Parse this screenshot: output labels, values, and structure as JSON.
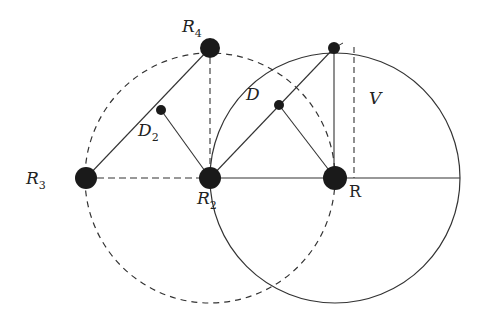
{
  "diagram": {
    "colors": {
      "stroke": "#333333",
      "node": "#1a1a1a",
      "background": "#ffffff"
    },
    "labels": {
      "R4": {
        "main": "R",
        "sub": "4"
      },
      "R3": {
        "main": "R",
        "sub": "3"
      },
      "R2": {
        "main": "R",
        "sub": "2"
      },
      "D2": {
        "main": "D",
        "sub": "2"
      },
      "D": "D",
      "V": "V",
      "R": "R"
    },
    "nodes": [
      {
        "id": "R3",
        "x": 86,
        "y": 178,
        "r": 11
      },
      {
        "id": "R2",
        "x": 210,
        "y": 178,
        "r": 11
      },
      {
        "id": "R",
        "x": 335,
        "y": 178,
        "r": 12
      },
      {
        "id": "R4",
        "x": 210,
        "y": 48,
        "r": 10
      },
      {
        "id": "top",
        "x": 334,
        "y": 48,
        "r": 6
      },
      {
        "id": "D2",
        "x": 161,
        "y": 110,
        "r": 5
      },
      {
        "id": "Dnode",
        "x": 279,
        "y": 105,
        "r": 5
      }
    ],
    "circles": [
      {
        "id": "dashed-circle",
        "cx": 210,
        "cy": 178,
        "r": 125,
        "style": "dashed"
      },
      {
        "id": "solid-circle",
        "cx": 335,
        "cy": 178,
        "r": 125,
        "style": "solid"
      }
    ]
  }
}
